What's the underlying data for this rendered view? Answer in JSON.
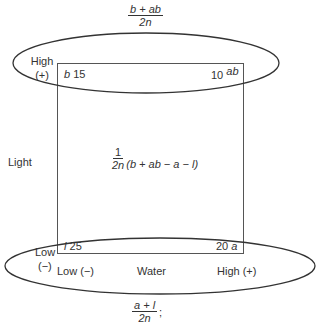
{
  "diagram": {
    "top_fraction": {
      "numerator": "b + ab",
      "denominator": "2n"
    },
    "bottom_fraction": {
      "numerator": "a + l",
      "denominator": "2n",
      "suffix": ";"
    },
    "center_expression": {
      "numerator": "1",
      "denominator": "2n",
      "expression": "(b + ab − a − l)"
    },
    "axis_light": {
      "label": "Light",
      "high_label": "High",
      "high_sign": "(+)",
      "low_label": "Low",
      "low_sign": "(−)"
    },
    "axis_water": {
      "label": "Water",
      "low_label": "Low (−)",
      "high_label": "High (+)"
    },
    "corners": {
      "top_left": {
        "symbol": "b",
        "value": "15"
      },
      "top_right": {
        "value": "10",
        "symbol": "ab"
      },
      "bottom_left": {
        "symbol": "l",
        "value": "25"
      },
      "bottom_right": {
        "value": "20",
        "symbol": "a"
      }
    },
    "colors": {
      "stroke": "#333333",
      "background": "#ffffff"
    }
  }
}
